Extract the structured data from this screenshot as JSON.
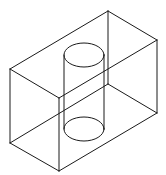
{
  "diagram": {
    "colors": {
      "stroke": "#1a1a1a",
      "background": "#ffffff"
    },
    "box": {
      "vertices": {
        "top_back": [
          108,
          11
        ],
        "top_right": [
          157,
          40
        ],
        "top_left": [
          10,
          69
        ],
        "top_front": [
          59,
          98
        ],
        "bottom_back": [
          108,
          84
        ],
        "bottom_right": [
          157,
          113
        ],
        "bottom_left": [
          10,
          143
        ],
        "bottom_front": [
          59,
          171
        ]
      }
    },
    "cylinder": {
      "top_ellipse": {
        "cx": 84,
        "cy": 55,
        "rx": 20,
        "ry": 12
      },
      "bottom_ellipse": {
        "cx": 84,
        "cy": 129,
        "rx": 20,
        "ry": 12
      }
    }
  }
}
